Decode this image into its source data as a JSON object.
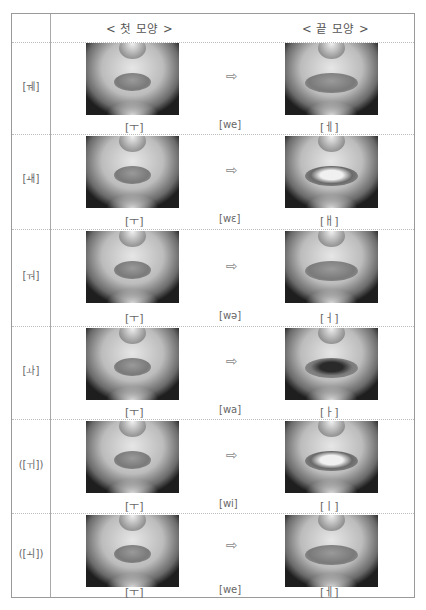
{
  "header": {
    "first_shape": "< 첫 모양 >",
    "last_shape": "< 끝 모양 >"
  },
  "rows": [
    {
      "vowel": "[ㅞ]",
      "start": "[ㅜ]",
      "ipa": "[we]",
      "end": "[ㅔ]",
      "end_mouth": "neutral",
      "arrow": "⇨"
    },
    {
      "vowel": "[ㅙ]",
      "start": "[ㅜ]",
      "ipa": "[wɛ]",
      "end": "[ㅐ]",
      "end_mouth": "teeth",
      "arrow": "⇨"
    },
    {
      "vowel": "[ㅝ]",
      "start": "[ㅜ]",
      "ipa": "[wə]",
      "end": "[ㅓ]",
      "end_mouth": "neutral",
      "arrow": "⇨"
    },
    {
      "vowel": "[ㅘ]",
      "start": "[ㅜ]",
      "ipa": "[wa]",
      "end": "[ㅏ]",
      "end_mouth": "open",
      "arrow": "⇨"
    },
    {
      "vowel": "([ㅟ])",
      "start": "[ㅜ]",
      "ipa": "[wi]",
      "end": "[ㅣ]",
      "end_mouth": "teeth",
      "arrow": "⇨"
    },
    {
      "vowel": "([ㅚ])",
      "start": "[ㅜ]",
      "ipa": "[we]",
      "end": "[ㅔ]",
      "end_mouth": "neutral",
      "arrow": "⇨"
    }
  ]
}
